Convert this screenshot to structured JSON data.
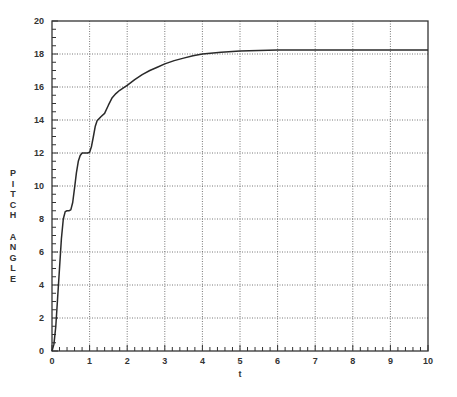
{
  "chart_data": {
    "type": "line",
    "title": "",
    "xlabel": "t",
    "ylabel": "PITCH ANGLE",
    "xlim": [
      0,
      10
    ],
    "ylim": [
      0,
      20
    ],
    "xticks": [
      0,
      1,
      2,
      3,
      4,
      5,
      6,
      7,
      8,
      9,
      10
    ],
    "yticks": [
      0,
      2,
      4,
      6,
      8,
      10,
      12,
      14,
      16,
      18,
      20
    ],
    "grid": true,
    "legend": null,
    "series": [
      {
        "name": "pitch angle",
        "x": [
          0,
          0.05,
          0.1,
          0.15,
          0.2,
          0.25,
          0.3,
          0.35,
          0.4,
          0.45,
          0.5,
          0.55,
          0.6,
          0.65,
          0.7,
          0.75,
          0.8,
          0.85,
          0.9,
          0.95,
          1.0,
          1.05,
          1.1,
          1.15,
          1.2,
          1.3,
          1.4,
          1.5,
          1.6,
          1.7,
          1.8,
          1.9,
          2.0,
          2.2,
          2.4,
          2.6,
          2.8,
          3.0,
          3.25,
          3.5,
          3.75,
          4.0,
          4.5,
          5.0,
          5.5,
          6.0,
          7.0,
          8.0,
          9.0,
          10.0
        ],
        "y": [
          0,
          0.4,
          1.5,
          3.2,
          5.0,
          6.8,
          8.0,
          8.45,
          8.5,
          8.5,
          8.55,
          9.0,
          9.9,
          10.8,
          11.5,
          11.85,
          12.0,
          12.0,
          12.0,
          12.0,
          12.05,
          12.4,
          13.0,
          13.6,
          13.95,
          14.2,
          14.4,
          14.9,
          15.35,
          15.6,
          15.8,
          15.95,
          16.1,
          16.45,
          16.75,
          17.0,
          17.2,
          17.4,
          17.6,
          17.75,
          17.9,
          18.0,
          18.1,
          18.18,
          18.22,
          18.24,
          18.25,
          18.25,
          18.25,
          18.25
        ]
      }
    ]
  }
}
